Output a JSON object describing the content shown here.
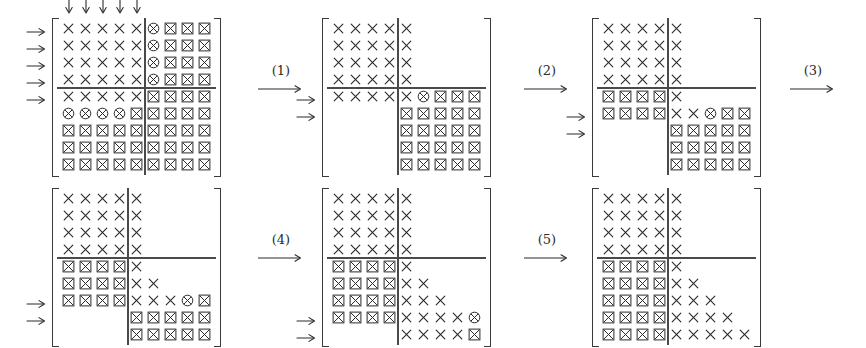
{
  "figure": {
    "glyph_legend": {
      "x": "plain-cross",
      "o": "circled-cross",
      "b": "boxed-cross",
      "_": "empty"
    },
    "colors": {
      "ink": "#2b2b2b",
      "rule": "#4a4a4a",
      "bracket": "#3a3a3a",
      "background": "#ffffff"
    },
    "cell": {
      "size": 17,
      "glyph_px": 11
    },
    "steps": [
      {
        "label": "(1)",
        "x": 258,
        "y": 63
      },
      {
        "label": "(2)",
        "x": 524,
        "y": 63
      },
      {
        "label": "(3)",
        "x": 790,
        "y": 63
      },
      {
        "label": "(4)",
        "x": 258,
        "y": 232
      },
      {
        "label": "(5)",
        "x": 524,
        "y": 232
      }
    ],
    "matrices": [
      {
        "name": "matrix-1",
        "x": 52,
        "y": 18,
        "rows": 9,
        "cols": 9,
        "vrule_after_col": 5,
        "hrule_after_row": 4,
        "hrule_from_col": 0,
        "hrule_to_col": 9,
        "vrule_from_row": 0,
        "vrule_to_row": 9,
        "row_arrows": [
          1,
          2,
          3,
          4,
          5
        ],
        "col_arrows": [
          1,
          2,
          3,
          4,
          5
        ],
        "data": [
          [
            "x",
            "x",
            "x",
            "x",
            "x",
            "o",
            "b",
            "b",
            "b"
          ],
          [
            "x",
            "x",
            "x",
            "x",
            "x",
            "o",
            "b",
            "b",
            "b"
          ],
          [
            "x",
            "x",
            "x",
            "x",
            "x",
            "o",
            "b",
            "b",
            "b"
          ],
          [
            "x",
            "x",
            "x",
            "x",
            "x",
            "o",
            "b",
            "b",
            "b"
          ],
          [
            "x",
            "x",
            "x",
            "x",
            "x",
            "b",
            "b",
            "b",
            "b"
          ],
          [
            "o",
            "o",
            "o",
            "o",
            "b",
            "b",
            "b",
            "b",
            "b"
          ],
          [
            "b",
            "b",
            "b",
            "b",
            "b",
            "b",
            "b",
            "b",
            "b"
          ],
          [
            "b",
            "b",
            "b",
            "b",
            "b",
            "b",
            "b",
            "b",
            "b"
          ],
          [
            "b",
            "b",
            "b",
            "b",
            "b",
            "b",
            "b",
            "b",
            "b"
          ]
        ]
      },
      {
        "name": "matrix-2",
        "x": 322,
        "y": 18,
        "rows": 9,
        "cols": 9,
        "vrule_after_col": 4,
        "hrule_after_row": 4,
        "hrule_from_col": 0,
        "hrule_to_col": 9,
        "vrule_from_row": 0,
        "vrule_to_row": 9,
        "row_arrows": [
          5,
          6
        ],
        "col_arrows": [],
        "data": [
          [
            "x",
            "x",
            "x",
            "x",
            "x",
            "_",
            "_",
            "_",
            "_"
          ],
          [
            "x",
            "x",
            "x",
            "x",
            "x",
            "_",
            "_",
            "_",
            "_"
          ],
          [
            "x",
            "x",
            "x",
            "x",
            "x",
            "_",
            "_",
            "_",
            "_"
          ],
          [
            "x",
            "x",
            "x",
            "x",
            "x",
            "_",
            "_",
            "_",
            "_"
          ],
          [
            "x",
            "x",
            "x",
            "x",
            "x",
            "o",
            "b",
            "b",
            "b"
          ],
          [
            "_",
            "_",
            "_",
            "_",
            "b",
            "b",
            "b",
            "b",
            "b"
          ],
          [
            "_",
            "_",
            "_",
            "_",
            "b",
            "b",
            "b",
            "b",
            "b"
          ],
          [
            "_",
            "_",
            "_",
            "_",
            "b",
            "b",
            "b",
            "b",
            "b"
          ],
          [
            "_",
            "_",
            "_",
            "_",
            "b",
            "b",
            "b",
            "b",
            "b"
          ]
        ]
      },
      {
        "name": "matrix-3",
        "x": 592,
        "y": 18,
        "rows": 9,
        "cols": 9,
        "vrule_after_col": 4,
        "hrule_after_row": 4,
        "hrule_from_col": 0,
        "hrule_to_col": 9,
        "vrule_from_row": 0,
        "vrule_to_row": 9,
        "row_arrows": [
          6,
          7
        ],
        "col_arrows": [],
        "data": [
          [
            "x",
            "x",
            "x",
            "x",
            "x",
            "_",
            "_",
            "_",
            "_"
          ],
          [
            "x",
            "x",
            "x",
            "x",
            "x",
            "_",
            "_",
            "_",
            "_"
          ],
          [
            "x",
            "x",
            "x",
            "x",
            "x",
            "_",
            "_",
            "_",
            "_"
          ],
          [
            "x",
            "x",
            "x",
            "x",
            "x",
            "_",
            "_",
            "_",
            "_"
          ],
          [
            "b",
            "b",
            "b",
            "b",
            "x",
            "_",
            "_",
            "_",
            "_"
          ],
          [
            "b",
            "b",
            "b",
            "b",
            "x",
            "x",
            "o",
            "b",
            "b"
          ],
          [
            "_",
            "_",
            "_",
            "_",
            "b",
            "b",
            "b",
            "b",
            "b"
          ],
          [
            "_",
            "_",
            "_",
            "_",
            "b",
            "b",
            "b",
            "b",
            "b"
          ],
          [
            "_",
            "_",
            "_",
            "_",
            "b",
            "b",
            "b",
            "b",
            "b"
          ]
        ]
      },
      {
        "name": "matrix-4",
        "x": 52,
        "y": 188,
        "rows": 9,
        "cols": 9,
        "vrule_after_col": 4,
        "hrule_after_row": 4,
        "hrule_from_col": 0,
        "hrule_to_col": 9,
        "vrule_from_row": 0,
        "vrule_to_row": 9,
        "row_arrows": [
          7,
          8
        ],
        "col_arrows": [],
        "data": [
          [
            "x",
            "x",
            "x",
            "x",
            "x",
            "_",
            "_",
            "_",
            "_"
          ],
          [
            "x",
            "x",
            "x",
            "x",
            "x",
            "_",
            "_",
            "_",
            "_"
          ],
          [
            "x",
            "x",
            "x",
            "x",
            "x",
            "_",
            "_",
            "_",
            "_"
          ],
          [
            "x",
            "x",
            "x",
            "x",
            "x",
            "_",
            "_",
            "_",
            "_"
          ],
          [
            "b",
            "b",
            "b",
            "b",
            "x",
            "_",
            "_",
            "_",
            "_"
          ],
          [
            "b",
            "b",
            "b",
            "b",
            "x",
            "x",
            "_",
            "_",
            "_"
          ],
          [
            "b",
            "b",
            "b",
            "b",
            "x",
            "x",
            "x",
            "o",
            "b"
          ],
          [
            "_",
            "_",
            "_",
            "_",
            "b",
            "b",
            "b",
            "b",
            "b"
          ],
          [
            "_",
            "_",
            "_",
            "_",
            "b",
            "b",
            "b",
            "b",
            "b"
          ]
        ]
      },
      {
        "name": "matrix-5",
        "x": 322,
        "y": 188,
        "rows": 9,
        "cols": 9,
        "vrule_after_col": 4,
        "hrule_after_row": 4,
        "hrule_from_col": 0,
        "hrule_to_col": 9,
        "vrule_from_row": 0,
        "vrule_to_row": 9,
        "row_arrows": [
          8,
          9
        ],
        "col_arrows": [],
        "data": [
          [
            "x",
            "x",
            "x",
            "x",
            "x",
            "_",
            "_",
            "_",
            "_"
          ],
          [
            "x",
            "x",
            "x",
            "x",
            "x",
            "_",
            "_",
            "_",
            "_"
          ],
          [
            "x",
            "x",
            "x",
            "x",
            "x",
            "_",
            "_",
            "_",
            "_"
          ],
          [
            "x",
            "x",
            "x",
            "x",
            "x",
            "_",
            "_",
            "_",
            "_"
          ],
          [
            "b",
            "b",
            "b",
            "b",
            "x",
            "_",
            "_",
            "_",
            "_"
          ],
          [
            "b",
            "b",
            "b",
            "b",
            "x",
            "x",
            "_",
            "_",
            "_"
          ],
          [
            "b",
            "b",
            "b",
            "b",
            "x",
            "x",
            "x",
            "_",
            "_"
          ],
          [
            "b",
            "b",
            "b",
            "b",
            "x",
            "x",
            "x",
            "x",
            "o"
          ],
          [
            "_",
            "_",
            "_",
            "_",
            "x",
            "x",
            "x",
            "x",
            "b"
          ]
        ]
      },
      {
        "name": "matrix-6",
        "x": 592,
        "y": 188,
        "rows": 9,
        "cols": 9,
        "vrule_after_col": 4,
        "hrule_after_row": 4,
        "hrule_from_col": 0,
        "hrule_to_col": 9,
        "vrule_from_row": 0,
        "vrule_to_row": 9,
        "row_arrows": [],
        "col_arrows": [],
        "data": [
          [
            "x",
            "x",
            "x",
            "x",
            "x",
            "_",
            "_",
            "_",
            "_"
          ],
          [
            "x",
            "x",
            "x",
            "x",
            "x",
            "_",
            "_",
            "_",
            "_"
          ],
          [
            "x",
            "x",
            "x",
            "x",
            "x",
            "_",
            "_",
            "_",
            "_"
          ],
          [
            "x",
            "x",
            "x",
            "x",
            "x",
            "_",
            "_",
            "_",
            "_"
          ],
          [
            "b",
            "b",
            "b",
            "b",
            "x",
            "_",
            "_",
            "_",
            "_"
          ],
          [
            "b",
            "b",
            "b",
            "b",
            "x",
            "x",
            "_",
            "_",
            "_"
          ],
          [
            "b",
            "b",
            "b",
            "b",
            "x",
            "x",
            "x",
            "_",
            "_"
          ],
          [
            "b",
            "b",
            "b",
            "b",
            "x",
            "x",
            "x",
            "x",
            "_"
          ],
          [
            "b",
            "b",
            "b",
            "b",
            "x",
            "x",
            "x",
            "x",
            "x"
          ]
        ]
      }
    ]
  }
}
